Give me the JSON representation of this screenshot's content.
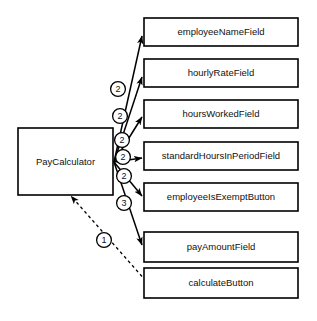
{
  "diagram": {
    "type": "uml-collaboration-diagram",
    "background_color": "#ffffff",
    "line_color": "#000000",
    "text_color": "#111111",
    "controller": {
      "label": "PayCalculator",
      "x": 18,
      "y": 128,
      "width": 95,
      "height": 67
    },
    "nodes": [
      {
        "id": "employeeNameField",
        "label": "employeeNameField",
        "x": 144,
        "y": 18,
        "width": 154,
        "height": 28
      },
      {
        "id": "hourlyRateField",
        "label": "hourlyRateField",
        "x": 144,
        "y": 59,
        "width": 154,
        "height": 28
      },
      {
        "id": "hoursWorkedField",
        "label": "hoursWorkedField",
        "x": 144,
        "y": 100,
        "width": 154,
        "height": 28
      },
      {
        "id": "standardHoursInPeriodField",
        "label": "standardHoursInPeriodField",
        "x": 144,
        "y": 142,
        "width": 154,
        "height": 28
      },
      {
        "id": "employeeIsExemptButton",
        "label": "employeeIsExemptButton",
        "x": 144,
        "y": 183,
        "width": 154,
        "height": 28
      },
      {
        "id": "payAmountField",
        "label": "payAmountField",
        "x": 144,
        "y": 232,
        "width": 154,
        "height": 30
      },
      {
        "id": "calculateButton",
        "label": "calculateButton",
        "x": 144,
        "y": 268,
        "width": 154,
        "height": 30
      }
    ],
    "messages": [
      {
        "id": "msg-employeeNameField",
        "sequence": "2",
        "from": "PayCalculator",
        "to": "employeeNameField",
        "style": "solid",
        "arrowhead": "filled",
        "from_x": 114,
        "from_y": 162,
        "to_x": 142,
        "to_y": 36,
        "badge_x": 118,
        "badge_y": 89
      },
      {
        "id": "msg-hourlyRateField",
        "sequence": "2",
        "from": "PayCalculator",
        "to": "hourlyRateField",
        "style": "solid",
        "arrowhead": "filled",
        "from_x": 114,
        "from_y": 162,
        "to_x": 142,
        "to_y": 77,
        "badge_x": 120,
        "badge_y": 116
      },
      {
        "id": "msg-hoursWorkedField",
        "sequence": "2",
        "from": "PayCalculator",
        "to": "hoursWorkedField",
        "style": "solid",
        "arrowhead": "filled",
        "from_x": 114,
        "from_y": 162,
        "to_x": 142,
        "to_y": 117,
        "badge_x": 122,
        "badge_y": 140
      },
      {
        "id": "msg-standardHoursInPeriodField",
        "sequence": "2",
        "from": "PayCalculator",
        "to": "standardHoursInPeriodField",
        "style": "solid",
        "arrowhead": "filled",
        "from_x": 114,
        "from_y": 162,
        "to_x": 142,
        "to_y": 158,
        "badge_x": 123,
        "badge_y": 157
      },
      {
        "id": "msg-employeeIsExemptButton",
        "sequence": "2",
        "from": "PayCalculator",
        "to": "employeeIsExemptButton",
        "style": "solid",
        "arrowhead": "filled",
        "from_x": 114,
        "from_y": 162,
        "to_x": 142,
        "to_y": 196,
        "badge_x": 124,
        "badge_y": 176
      },
      {
        "id": "msg-payAmountField",
        "sequence": "3",
        "from": "PayCalculator",
        "to": "payAmountField",
        "style": "solid",
        "arrowhead": "filled",
        "from_x": 114,
        "from_y": 162,
        "to_x": 142,
        "to_y": 245,
        "badge_x": 124,
        "badge_y": 203
      },
      {
        "id": "msg-calculateButton",
        "sequence": "1",
        "from": "calculateButton",
        "to": "PayCalculator",
        "style": "dashed",
        "arrowhead": "filled",
        "from_x": 146,
        "from_y": 281,
        "to_x": 71,
        "to_y": 196,
        "badge_x": 104,
        "badge_y": 240
      }
    ]
  }
}
